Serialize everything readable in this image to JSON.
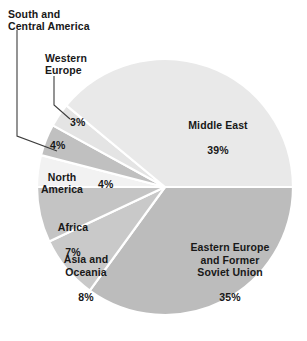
{
  "chart_data": {
    "type": "pie",
    "title": "",
    "subtitle": "",
    "xlabel": "",
    "ylabel": "",
    "legend_position": "none",
    "grid": false,
    "units": "percent",
    "total": 100,
    "center": {
      "x": 165,
      "y": 187
    },
    "radius": 128,
    "start_angle_deg": 0,
    "direction": "clockwise",
    "categories": [
      "Eastern Europe and Former Soviet Union",
      "Asia and Oceania",
      "Africa",
      "North America",
      "South and Central America",
      "Western Europe",
      "Middle East"
    ],
    "values": [
      35,
      8,
      7,
      4,
      4,
      3,
      39
    ],
    "slices": [
      {
        "id": "eastern-europe",
        "name": "Eastern Europe\nand Former\nSoviet Union",
        "value": 35,
        "percent_label": "35%",
        "color": "#bcbcbc",
        "label_placement": "inside"
      },
      {
        "id": "asia-oceania",
        "name": "Asia and\nOceania",
        "value": 8,
        "percent_label": "8%",
        "color": "#c9c9c9",
        "label_placement": "inside"
      },
      {
        "id": "africa",
        "name": "Africa",
        "value": 7,
        "percent_label": "7%",
        "color": "#c4c4c4",
        "label_placement": "inside"
      },
      {
        "id": "north-america",
        "name": "North\nAmerica",
        "value": 4,
        "percent_label": "4%",
        "color": "#f2f2f2",
        "label_placement": "inside"
      },
      {
        "id": "south-central-america",
        "name": "South and\nCentral America",
        "value": 4,
        "percent_label": "4%",
        "color": "#c0c0c0",
        "label_placement": "callout"
      },
      {
        "id": "western-europe",
        "name": "Western\nEurope",
        "value": 3,
        "percent_label": "3%",
        "color": "#e4e4e4",
        "label_placement": "callout"
      },
      {
        "id": "middle-east",
        "name": "Middle East",
        "value": 39,
        "percent_label": "39%",
        "color": "#e9e9e9",
        "label_placement": "inside"
      }
    ],
    "colors": {
      "background": "#ffffff",
      "separator": "#ffffff",
      "text": "#181818",
      "leader_line": "#3c3c3c"
    }
  },
  "labels": {
    "middle_east": {
      "name": "Middle East",
      "percent": "39%"
    },
    "eastern_europe": {
      "name": "Eastern Europe\nand Former\nSoviet Union",
      "percent": "35%"
    },
    "africa": {
      "name": "Africa",
      "percent": "7%"
    },
    "asia_oceania": {
      "name": "Asia and\nOceania",
      "percent": "8%"
    },
    "north_america": {
      "name": "North\nAmerica",
      "percent": "4%"
    },
    "south_central_america": {
      "name": "South and\nCentral America",
      "percent": "4%"
    },
    "western_europe": {
      "name": "Western\nEurope",
      "percent": "3%"
    }
  }
}
